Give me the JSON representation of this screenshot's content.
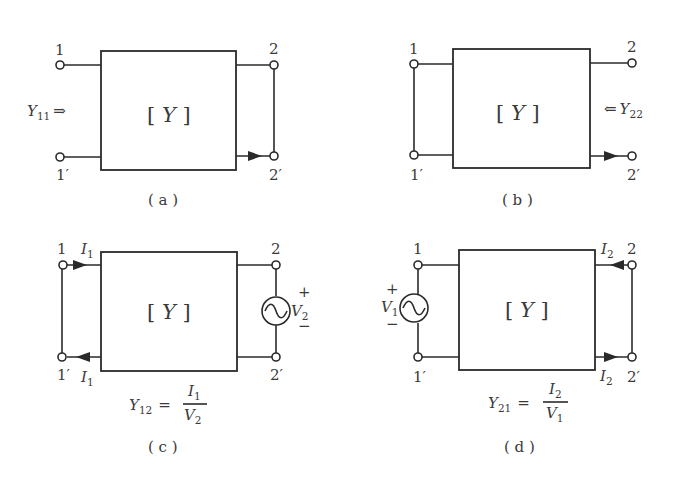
{
  "figure": {
    "matrix_label": "Y",
    "panels": [
      {
        "id": "a",
        "caption": "( a )",
        "terminals": {
          "t1": "1",
          "t1p": "1′",
          "t2": "2",
          "t2p": "2′"
        },
        "port1": "open",
        "port2": "short",
        "admittance": {
          "symbol": "Y",
          "sub": "11",
          "arrow": "⇒"
        },
        "current_arrow": "port2 bottom, pointing right"
      },
      {
        "id": "b",
        "caption": "( b )",
        "terminals": {
          "t1": "1",
          "t1p": "1′",
          "t2": "2",
          "t2p": "2′"
        },
        "port1": "short",
        "port2": "open",
        "admittance": {
          "symbol": "Y",
          "sub": "22",
          "arrow": "⇐"
        },
        "current_arrow": "port2 bottom, pointing right"
      },
      {
        "id": "c",
        "caption": "( c )",
        "terminals": {
          "t1": "1",
          "t1p": "1′",
          "t2": "2",
          "t2p": "2′"
        },
        "port1": "short",
        "port2": "voltage source",
        "currents": {
          "top": {
            "symbol": "I",
            "sub": "1"
          },
          "bottom": {
            "symbol": "I",
            "sub": "1"
          }
        },
        "source": {
          "symbol": "V",
          "sub": "2",
          "plus": "+",
          "minus": "−"
        },
        "formula": {
          "lhs": "Y",
          "lhs_sub": "12",
          "eq": "=",
          "num": "I",
          "num_sub": "1",
          "den": "V",
          "den_sub": "2"
        }
      },
      {
        "id": "d",
        "caption": "( d )",
        "terminals": {
          "t1": "1",
          "t1p": "1′",
          "t2": "2",
          "t2p": "2′"
        },
        "port1": "voltage source",
        "port2": "short",
        "currents": {
          "top": {
            "symbol": "I",
            "sub": "2"
          },
          "bottom": {
            "symbol": "I",
            "sub": "2"
          }
        },
        "source": {
          "symbol": "V",
          "sub": "1",
          "plus": "+",
          "minus": "−"
        },
        "formula": {
          "lhs": "Y",
          "lhs_sub": "21",
          "eq": "=",
          "num": "I",
          "num_sub": "2",
          "den": "V",
          "den_sub": "1"
        }
      }
    ]
  }
}
